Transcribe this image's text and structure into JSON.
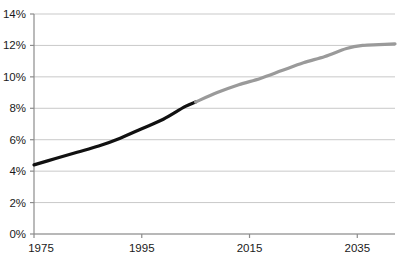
{
  "chart_data": {
    "type": "line",
    "title": "",
    "xlabel": "",
    "ylabel": "",
    "xlim": [
      1975,
      2042
    ],
    "ylim": [
      0,
      14
    ],
    "grid": true,
    "legend": "none",
    "x_tick_labels": [
      "1975",
      "1995",
      "2015",
      "2035"
    ],
    "x_ticks": [
      1975,
      1995,
      2015,
      2035
    ],
    "y_tick_labels": [
      "0%",
      "2%",
      "4%",
      "6%",
      "8%",
      "10%",
      "12%",
      "14%"
    ],
    "y_ticks": [
      0,
      2,
      4,
      6,
      8,
      10,
      12,
      14
    ],
    "series": [
      {
        "name": "historical",
        "color": "#111111",
        "x": [
          1975,
          1979,
          1983,
          1987,
          1991,
          1995,
          1999,
          2003,
          2005
        ],
        "values": [
          4.4,
          4.8,
          5.2,
          5.6,
          6.1,
          6.7,
          7.3,
          8.1,
          8.4
        ]
      },
      {
        "name": "projected",
        "color": "#9a9a9a",
        "x": [
          2005,
          2009,
          2013,
          2017,
          2021,
          2025,
          2029,
          2033,
          2036,
          2039,
          2042
        ],
        "values": [
          8.4,
          9.0,
          9.5,
          9.9,
          10.4,
          10.9,
          11.3,
          11.8,
          12.0,
          12.05,
          12.1
        ]
      }
    ],
    "axis_color": "#8c8c8c",
    "grid_color": "#c9c9c9"
  },
  "geometry": {
    "plot_left": 34,
    "plot_right": 395,
    "plot_top": 14,
    "plot_bottom": 234
  }
}
